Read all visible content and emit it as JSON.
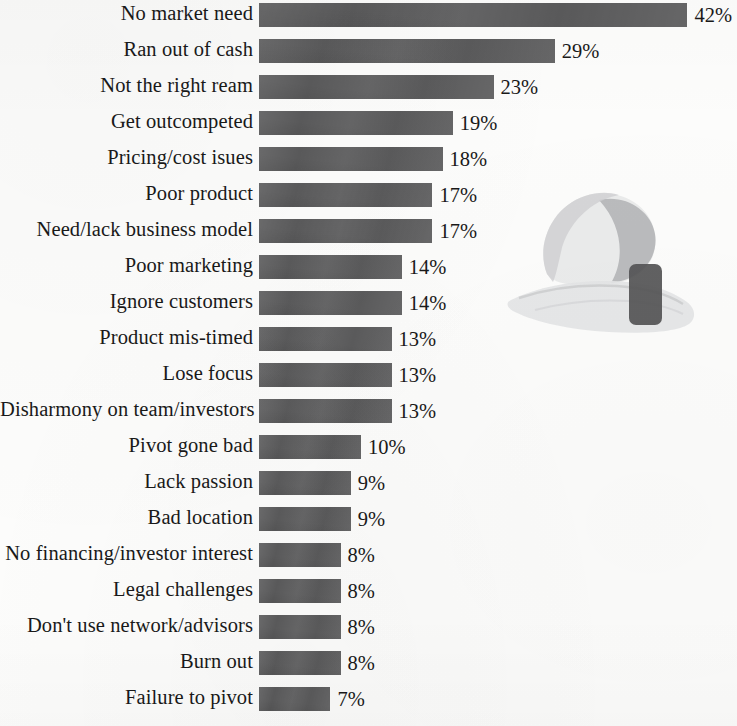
{
  "chart_data": {
    "type": "bar",
    "orientation": "horizontal",
    "title": "",
    "subtitle": "",
    "xlabel": "",
    "ylabel": "",
    "xlim": [
      0,
      42
    ],
    "grid": false,
    "legend": null,
    "value_suffix": "%",
    "categories": [
      "No market need",
      "Ran out of cash",
      "Not the right ream",
      "Get outcompeted",
      "Pricing/cost isues",
      "Poor product",
      "Need/lack business model",
      "Poor marketing",
      "Ignore customers",
      "Product mis-timed",
      "Lose focus",
      "Disharmony on team/investors",
      "Pivot gone bad",
      "Lack passion",
      "Bad location",
      "No financing/investor interest",
      "Legal challenges",
      "Don't use network/advisors",
      "Burn out",
      "Failure to pivot"
    ],
    "values": [
      42,
      29,
      23,
      19,
      18,
      17,
      17,
      14,
      14,
      13,
      13,
      13,
      10,
      9,
      9,
      8,
      8,
      8,
      8,
      7
    ],
    "data_labels": [
      "42%",
      "29%",
      "23%",
      "19%",
      "18%",
      "17%",
      "17%",
      "14%",
      "14%",
      "13%",
      "13%",
      "13%",
      "10%",
      "9%",
      "9%",
      "8%",
      "8%",
      "8%",
      "8%",
      "7%"
    ],
    "bar_color": "#5a5a5b",
    "background_color": "#fcfcfb",
    "text_color": "#191919"
  },
  "watermark": {
    "description": "open-hand-holding-sphere",
    "hand_color": "#d9dadb",
    "sphere_color": "#b9babb",
    "block_color": "#555556"
  }
}
